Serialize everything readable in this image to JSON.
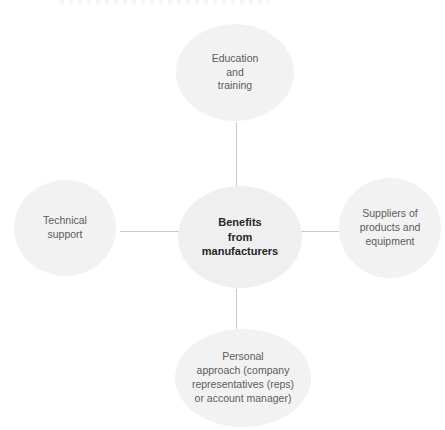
{
  "diagram": {
    "type": "hub-and-spoke",
    "center": {
      "id": "benefits-from-manufacturers",
      "label": "Benefits\nfrom\nmanufacturers"
    },
    "nodes": [
      {
        "id": "education-and-training",
        "position": "top",
        "label": "Education\nand\ntraining"
      },
      {
        "id": "technical-support",
        "position": "left",
        "label": "Technical\nsupport"
      },
      {
        "id": "suppliers-of-products-and-equipment",
        "position": "right",
        "label": "Suppliers of\nproducts and\nequipment"
      },
      {
        "id": "personal-approach",
        "position": "bottom",
        "label": "Personal\napproach (company\nrepresentatives (reps)\nor account manager)"
      }
    ],
    "connectors": [
      {
        "id": "center-to-top",
        "orientation": "vertical"
      },
      {
        "id": "center-to-bottom",
        "orientation": "vertical"
      },
      {
        "id": "center-to-left",
        "orientation": "horizontal"
      },
      {
        "id": "center-to-right",
        "orientation": "horizontal"
      }
    ],
    "colors": {
      "background": "#ffffff",
      "node_fill": "#f2f2f2",
      "center_node_fill": "#efefef",
      "connector": "#c9c9c9",
      "center_text": "#262626",
      "outer_text": "#5c5c5c"
    }
  }
}
